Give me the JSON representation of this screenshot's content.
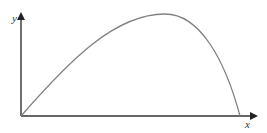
{
  "figure": {
    "axes": {
      "x_label": "x",
      "y_label": "y",
      "color": "#333333"
    },
    "curve": {
      "description": "Asymmetric hump curve rising from origin, peaking right of center, falling steeply back to x-axis",
      "color": "#808080",
      "start": [
        0,
        0
      ],
      "peak_relative_x": 0.66,
      "end_relative_x": 0.94
    }
  }
}
